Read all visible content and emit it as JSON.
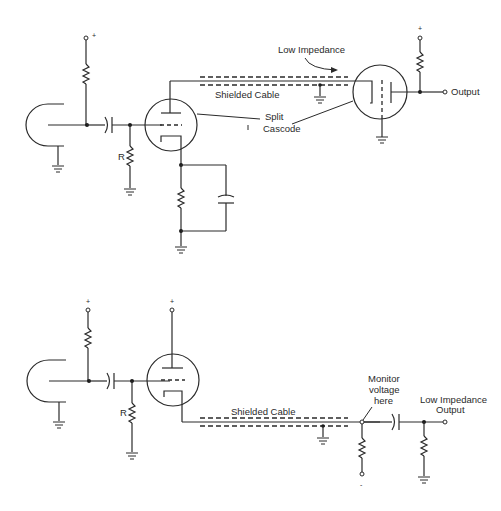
{
  "diagram": {
    "type": "vacuum-tube circuit schematics",
    "top_circuit": {
      "labels": {
        "supply": "+",
        "grid_resistor": "R",
        "low_impedance": "Low Impedance",
        "shielded_cable": "Shielded Cable",
        "split_line1": "Split",
        "split_line2": "Cascode",
        "output": "Output"
      }
    },
    "bottom_circuit": {
      "labels": {
        "supply_left": "+",
        "supply_tube": "+",
        "grid_resistor": "R",
        "shielded_cable": "Shielded Cable",
        "monitor_line1": "Monitor",
        "monitor_line2": "voltage",
        "monitor_line3": "here",
        "output_line1": "Low Impedance",
        "output_line2": "Output",
        "minus": "-"
      }
    },
    "colors": {
      "ink": "#2a2a2a",
      "background": "#ffffff"
    }
  }
}
